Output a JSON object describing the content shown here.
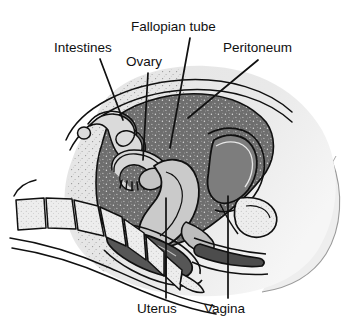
{
  "figure": {
    "name": "female-pelvis-sagittal-section",
    "background_color": "#ffffff",
    "line_color": "#101010",
    "label_color": "#101010",
    "label_font_size_px": 13.5
  },
  "labels": [
    {
      "id": "fallopian-tube",
      "text": "Fallopian tube",
      "x": 131,
      "y": 20,
      "leader": {
        "x1": 190,
        "y1": 38,
        "x2": 170,
        "y2": 148
      }
    },
    {
      "id": "intestines",
      "text": "Intestines",
      "x": 54,
      "y": 41,
      "leader": {
        "x1": 100,
        "y1": 59,
        "x2": 123,
        "y2": 120
      }
    },
    {
      "id": "ovary",
      "text": "Ovary",
      "x": 126,
      "y": 55,
      "leader": {
        "x1": 148,
        "y1": 73,
        "x2": 143,
        "y2": 160
      }
    },
    {
      "id": "peritoneum",
      "text": "Peritoneum",
      "x": 223,
      "y": 41,
      "leader": {
        "x1": 258,
        "y1": 60,
        "x2": 188,
        "y2": 118
      }
    },
    {
      "id": "uterus",
      "text": "Uterus",
      "x": 137,
      "y": 302,
      "leader": {
        "x1": 166,
        "y1": 298,
        "x2": 166,
        "y2": 198
      }
    },
    {
      "id": "vagina",
      "text": "Vagina",
      "x": 204,
      "y": 302,
      "leader": {
        "x1": 228,
        "y1": 298,
        "x2": 228,
        "y2": 196
      }
    }
  ],
  "anatomy": {
    "regions": [
      {
        "id": "body-silhouette",
        "label": "Body / abdominal wall",
        "fill": "#e9e9e9"
      },
      {
        "id": "abdominal-tissue",
        "label": "Abdominal soft tissue",
        "fill": "#e2e2e2"
      },
      {
        "id": "peritoneal-cavity",
        "label": "Peritoneal cavity",
        "fill": "#6e6e6e"
      },
      {
        "id": "uterus-body",
        "label": "Uterus",
        "fill": "#c9c9c9"
      },
      {
        "id": "ovary-body",
        "label": "Ovary",
        "fill": "#bfbfbf"
      },
      {
        "id": "fallopian-tube",
        "label": "Fallopian tube",
        "fill": "#d4d4d4"
      },
      {
        "id": "bladder",
        "label": "Bladder",
        "fill": "#7a7a7a"
      },
      {
        "id": "rectum",
        "label": "Rectum",
        "fill": "#555555"
      },
      {
        "id": "vagina-canal",
        "label": "Vagina",
        "fill": "#4f4f4f"
      },
      {
        "id": "sacrum-vertebrae",
        "label": "Sacrum / vertebrae",
        "fill": "#ececec"
      },
      {
        "id": "intestine-loop",
        "label": "Intestine loop",
        "fill": "#d9d9d9"
      },
      {
        "id": "pubic-bone",
        "label": "Pubic bone",
        "fill": "#d2d2d2"
      }
    ]
  }
}
